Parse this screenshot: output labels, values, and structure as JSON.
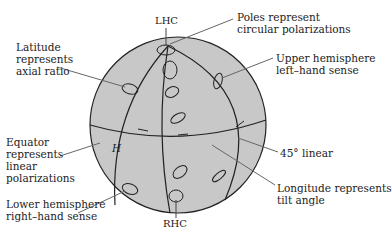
{
  "diagram": {
    "type": "poincare-sphere",
    "colors": {
      "sphere_fill": "#c8c8c8",
      "line": "#222222",
      "leader": "#666666",
      "background": "#ffffff"
    },
    "labels": {
      "top_pole": "LHC",
      "bottom_pole": "RHC",
      "equator_letter": "H",
      "poles": "Poles represent\ncircular polarizations",
      "latitude": "Latitude\nrepresents\naxial ratio",
      "upper": "Upper hemisphere\nleft–hand sense",
      "equator": "Equator\nrepresents\nlinear\npolarizations",
      "linear45": "45° linear",
      "longitude": "Longitude represents\ntilt angle",
      "lower": "Lower hemisphere\nright–hand sense"
    }
  }
}
